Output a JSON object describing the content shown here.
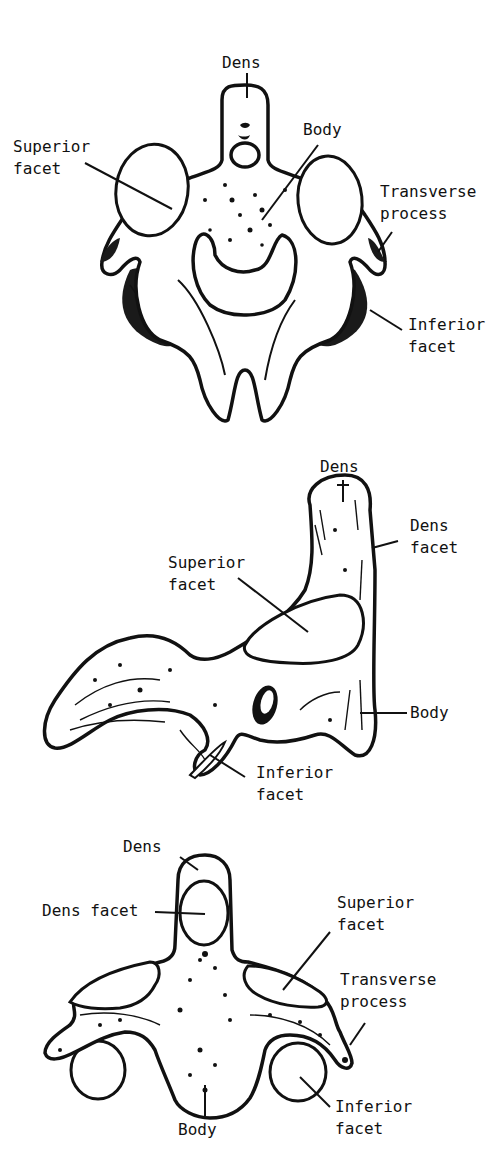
{
  "figures": [
    {
      "id": "atlas-axis-anterior-view",
      "view": "anterior",
      "labels": {
        "dens": "Dens",
        "body": "Body",
        "superior_facet": "Superior\nfacet",
        "transverse_process": "Transverse\nprocess",
        "inferior_facet": "Inferior\nfacet"
      }
    },
    {
      "id": "axis-lateral-view",
      "view": "lateral",
      "labels": {
        "dens": "Dens",
        "dens_facet": "Dens\nfacet",
        "superior_facet": "Superior\nfacet",
        "body": "Body",
        "inferior_facet": "Inferior\nfacet"
      }
    },
    {
      "id": "axis-posterior-view",
      "view": "anterior-lower",
      "labels": {
        "dens": "Dens",
        "dens_facet": "Dens facet",
        "superior_facet": "Superior\nfacet",
        "transverse_process": "Transverse\nprocess",
        "inferior_facet": "Inferior\nfacet",
        "body": "Body"
      }
    }
  ],
  "colors": {
    "ink": "#111111",
    "paper": "#ffffff"
  }
}
